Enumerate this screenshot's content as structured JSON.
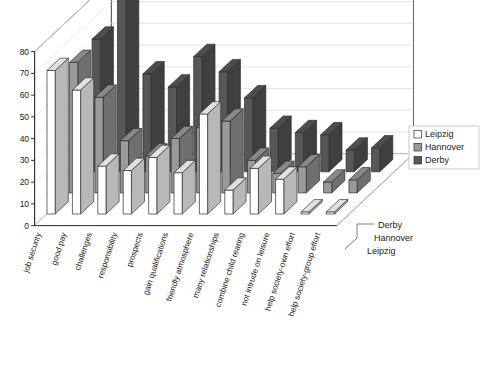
{
  "chart_data": {
    "type": "bar",
    "title": "",
    "subtitle": "",
    "xlabel": "",
    "ylabel": "",
    "ylim": [
      0,
      80
    ],
    "yticks": [
      0,
      10,
      20,
      30,
      40,
      50,
      60,
      70,
      80
    ],
    "grid": true,
    "projection": "3d",
    "legend_position": "right",
    "categories": [
      "job security",
      "good pay",
      "challenges",
      "responsibility",
      "prospects",
      "gain qualifications",
      "friendly atmosphere",
      "many relationships",
      "combine child rearing",
      "not intrude on leisure",
      "help society-own effort",
      "help society-group effort"
    ],
    "series": [
      {
        "name": "Leipzig",
        "color": "#ffffff",
        "values": [
          66,
          57,
          22,
          20,
          26,
          19,
          46,
          11,
          21,
          16,
          1,
          1
        ]
      },
      {
        "name": "Hannover",
        "color": "#9a9a9a",
        "values": [
          60,
          44,
          24,
          17,
          25,
          30,
          33,
          15,
          9,
          12,
          5,
          6
        ]
      },
      {
        "name": "Derby",
        "color": "#575757",
        "values": [
          61,
          80,
          45,
          39,
          53,
          46,
          34,
          20,
          18,
          17,
          10,
          11
        ]
      }
    ],
    "depth_axis_labels": [
      "Derby",
      "Hannover",
      "Leipzig"
    ]
  },
  "legend": {
    "items": [
      {
        "label": "Leipzig",
        "swatch": "#ffffff"
      },
      {
        "label": "Hannover",
        "swatch": "#9a9a9a"
      },
      {
        "label": "Derby",
        "swatch": "#575757"
      }
    ]
  },
  "yticks": {
    "t0": "0",
    "t1": "10",
    "t2": "20",
    "t3": "30",
    "t4": "40",
    "t5": "50",
    "t6": "60",
    "t7": "70",
    "t8": "80"
  },
  "cats": {
    "c0": "job security",
    "c1": "good pay",
    "c2": "challenges",
    "c3": "responsibility",
    "c4": "prospects",
    "c5": "gain qualifications",
    "c6": "friendly atmosphere",
    "c7": "many relationships",
    "c8": "combine child rearing",
    "c9": "not intrude on leisure",
    "c10": "help society-own effort",
    "c11": "help society-group effort"
  },
  "depth": {
    "d0": "Derby",
    "d1": "Hannover",
    "d2": "Leipzig"
  }
}
